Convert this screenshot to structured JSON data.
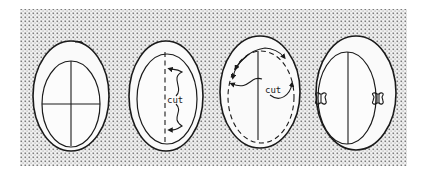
{
  "figure": {
    "background_pattern": "stipple",
    "colors": {
      "ink": "#1a1a1a",
      "paper": "#ffffff",
      "stipple": "#8a8a8a"
    },
    "panels": [
      {
        "id": "step-1",
        "caption": ""
      },
      {
        "id": "step-2",
        "caption": "cut"
      },
      {
        "id": "step-3",
        "caption": "cut"
      },
      {
        "id": "step-4",
        "caption": ""
      }
    ]
  }
}
